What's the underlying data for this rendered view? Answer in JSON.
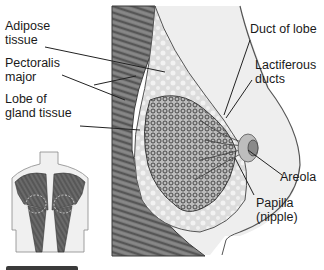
{
  "diagram": {
    "labels_left": [
      {
        "id": "adipose",
        "text": "Adipose\ntissue"
      },
      {
        "id": "pectoralis",
        "text": "Pectoralis\nmajor"
      },
      {
        "id": "lobe",
        "text": "Lobe of\ngland tissue"
      }
    ],
    "labels_right": [
      {
        "id": "duct",
        "text": "Duct of lobe"
      },
      {
        "id": "lactiferous",
        "text": "Lactiferous\nducts"
      },
      {
        "id": "areola",
        "text": "Areola"
      },
      {
        "id": "papilla",
        "text": "Papilla\n(nipple)"
      }
    ],
    "colors": {
      "muscle_dark": "#5a5a5a",
      "muscle_light": "#8c8c8c",
      "fat": "#e2e2e2",
      "skin": "#ececec",
      "gland": "#6e6e6e",
      "outline": "#444444",
      "leader": "#222222"
    }
  }
}
